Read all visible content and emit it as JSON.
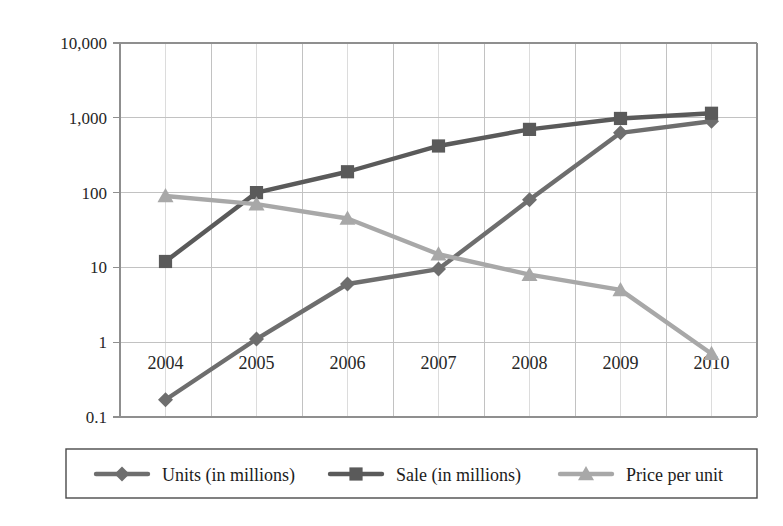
{
  "chart_data": {
    "type": "line",
    "title": "",
    "subtitle": "",
    "xlabel": "",
    "ylabel": "",
    "yscale": "log",
    "ylim": [
      0.1,
      10000
    ],
    "grid": true,
    "legend_position": "bottom",
    "categories": [
      "2004",
      "2005",
      "2006",
      "2007",
      "2008",
      "2009",
      "2010"
    ],
    "x": [
      2004,
      2005,
      2006,
      2007,
      2008,
      2009,
      2010
    ],
    "xtick_labels": [
      "2004",
      "2005",
      "2006",
      "2007",
      "2008",
      "2009",
      "2010"
    ],
    "ytick_labels": [
      "10,000",
      "1,000",
      "100",
      "10",
      "1",
      "0.1"
    ],
    "ytick_values": [
      10000,
      1000,
      100,
      10,
      1,
      0.1
    ],
    "series": [
      {
        "name": "Units (in millions)",
        "marker": "diamond",
        "color": "#6e6e6e",
        "values": [
          0.17,
          1.1,
          6,
          9.5,
          80,
          630,
          900
        ]
      },
      {
        "name": "Sale (in millions)",
        "marker": "square",
        "color": "#5a5a5a",
        "values": [
          12,
          100,
          190,
          420,
          700,
          980,
          1150
        ]
      },
      {
        "name": "Price per unit",
        "marker": "triangle",
        "color": "#a8a8a8",
        "values": [
          90,
          70,
          45,
          15,
          8,
          5,
          0.7
        ]
      }
    ]
  },
  "legend": {
    "items": [
      {
        "label": "Units (in millions)"
      },
      {
        "label": "Sale (in millions)"
      },
      {
        "label": "Price per unit"
      }
    ]
  }
}
